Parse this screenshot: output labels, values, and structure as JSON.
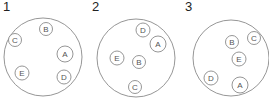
{
  "colors": {
    "stroke": "#8a8a8a",
    "text": "#222222",
    "label": "#555555"
  },
  "panels": [
    {
      "number": "1",
      "circle": {
        "cx": 43,
        "cy": 57,
        "r": 39
      },
      "items": [
        {
          "label": "B",
          "cx": 46,
          "cy": 29,
          "r": 6.5
        },
        {
          "label": "C",
          "cx": 15,
          "cy": 40,
          "r": 6.5
        },
        {
          "label": "A",
          "cx": 65,
          "cy": 54,
          "r": 8
        },
        {
          "label": "E",
          "cx": 22,
          "cy": 73,
          "r": 7
        },
        {
          "label": "D",
          "cx": 64,
          "cy": 77,
          "r": 7
        }
      ]
    },
    {
      "number": "2",
      "circle": {
        "cx": 136,
        "cy": 58,
        "r": 39
      },
      "items": [
        {
          "label": "D",
          "cx": 143,
          "cy": 30,
          "r": 7
        },
        {
          "label": "A",
          "cx": 158,
          "cy": 44,
          "r": 8
        },
        {
          "label": "E",
          "cx": 117,
          "cy": 58,
          "r": 7
        },
        {
          "label": "B",
          "cx": 139,
          "cy": 62,
          "r": 6.5
        },
        {
          "label": "C",
          "cx": 135,
          "cy": 87,
          "r": 6.5
        }
      ]
    },
    {
      "number": "3",
      "circle": {
        "cx": 231,
        "cy": 58,
        "r": 38
      },
      "items": [
        {
          "label": "B",
          "cx": 232,
          "cy": 42,
          "r": 6.5
        },
        {
          "label": "C",
          "cx": 254,
          "cy": 38,
          "r": 6.5
        },
        {
          "label": "E",
          "cx": 239,
          "cy": 59,
          "r": 7
        },
        {
          "label": "D",
          "cx": 211,
          "cy": 78,
          "r": 7
        },
        {
          "label": "A",
          "cx": 240,
          "cy": 85,
          "r": 8
        }
      ]
    }
  ],
  "number_positions": [
    {
      "x": 3,
      "y": 11
    },
    {
      "x": 92,
      "y": 11
    },
    {
      "x": 185,
      "y": 11
    }
  ]
}
